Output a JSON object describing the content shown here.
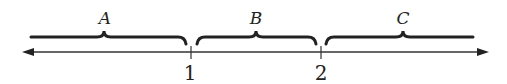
{
  "diagram": {
    "type": "number-line",
    "regions": [
      {
        "label": "A",
        "from": "-infinity",
        "to": "1"
      },
      {
        "label": "B",
        "from": "1",
        "to": "2"
      },
      {
        "label": "C",
        "from": "2",
        "to": "+infinity"
      }
    ],
    "ticks": [
      {
        "value": "1"
      },
      {
        "value": "2"
      }
    ],
    "colors": {
      "ink": "#222222",
      "background": "#ffffff"
    }
  }
}
